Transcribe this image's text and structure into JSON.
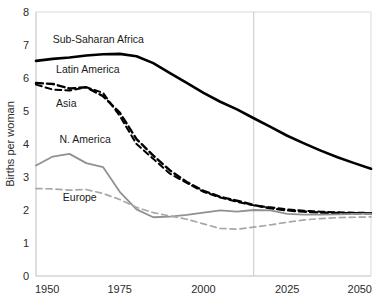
{
  "chart_data": {
    "type": "line",
    "title": "",
    "subtitle": "",
    "xlabel": "",
    "ylabel": "Births per woman",
    "xlim": [
      1950,
      2050
    ],
    "ylim": [
      0,
      8
    ],
    "x_ticks": [
      "1950",
      "1975",
      "2000",
      "2025",
      "2050"
    ],
    "x_tick_values": [
      1950,
      1975,
      2000,
      2025,
      2050
    ],
    "y_ticks": [
      "0",
      "1",
      "2",
      "3",
      "4",
      "5",
      "6",
      "7",
      "8"
    ],
    "y_tick_values": [
      0,
      1,
      2,
      3,
      4,
      5,
      6,
      7,
      8
    ],
    "grid": "vertical-reference-line-only",
    "legend_position": "inline-series-labels",
    "annotations": [
      {
        "name": "projection-divider",
        "type": "vertical-line",
        "x": 2015,
        "color": "#c8c8c8",
        "label": ""
      }
    ],
    "x": [
      1950,
      1955,
      1960,
      1965,
      1970,
      1975,
      1980,
      1985,
      1990,
      1995,
      2000,
      2005,
      2010,
      2015,
      2020,
      2025,
      2030,
      2035,
      2040,
      2045,
      2050
    ],
    "series": [
      {
        "name": "Sub-Saharan Africa",
        "label": "Sub-Saharan Africa",
        "color": "#000000",
        "style": "solid",
        "width": 2.6,
        "label_x": 1955,
        "label_y": 7.05,
        "values": [
          6.52,
          6.58,
          6.62,
          6.68,
          6.72,
          6.73,
          6.66,
          6.45,
          6.15,
          5.85,
          5.55,
          5.28,
          5.05,
          4.78,
          4.52,
          4.25,
          4.02,
          3.8,
          3.6,
          3.42,
          3.25
        ]
      },
      {
        "name": "Latin America",
        "label": "Latin America",
        "color": "#000000",
        "style": "dashed-thick",
        "width": 2.4,
        "label_x": 1956,
        "label_y": 6.15,
        "values": [
          5.85,
          5.82,
          5.68,
          5.72,
          5.45,
          4.95,
          4.15,
          3.65,
          3.2,
          2.85,
          2.58,
          2.4,
          2.28,
          2.15,
          2.05,
          1.99,
          1.95,
          1.92,
          1.91,
          1.9,
          1.9
        ]
      },
      {
        "name": "Asia",
        "label": "Asia",
        "color": "#000000",
        "style": "dashed-thin",
        "width": 2.0,
        "label_x": 1956,
        "label_y": 5.12,
        "values": [
          5.8,
          5.65,
          5.62,
          5.72,
          5.55,
          4.85,
          4.0,
          3.55,
          3.1,
          2.82,
          2.55,
          2.38,
          2.25,
          2.14,
          2.08,
          2.02,
          1.98,
          1.95,
          1.93,
          1.92,
          1.91
        ]
      },
      {
        "name": "N. America",
        "label": "N. America",
        "color": "#919191",
        "style": "solid",
        "width": 1.8,
        "label_x": 1957,
        "label_y": 4.02,
        "values": [
          3.35,
          3.62,
          3.7,
          3.42,
          3.3,
          2.55,
          2.02,
          1.78,
          1.8,
          1.85,
          1.92,
          1.99,
          1.95,
          2.0,
          1.99,
          1.88,
          1.86,
          1.86,
          1.87,
          1.88,
          1.89
        ]
      },
      {
        "name": "Europe",
        "label": "Europe",
        "color": "#a8a8a8",
        "style": "dashed-thin",
        "width": 1.7,
        "label_x": 1958,
        "label_y": 2.28,
        "values": [
          2.65,
          2.64,
          2.6,
          2.62,
          2.5,
          2.32,
          2.08,
          1.92,
          1.82,
          1.72,
          1.58,
          1.44,
          1.42,
          1.48,
          1.55,
          1.63,
          1.7,
          1.74,
          1.77,
          1.78,
          1.79
        ]
      }
    ]
  }
}
